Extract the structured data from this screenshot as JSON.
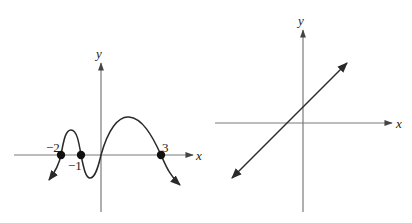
{
  "left_graph": {
    "axis_labels": {
      "x": "x",
      "y": "y"
    },
    "zero_labels": [
      "−2",
      "−1",
      "3"
    ],
    "zeros": [
      -2,
      -1,
      3
    ],
    "description": "Polynomial curve crossing the x-axis at -2, -1, 0, and 3, with end behavior falling on both sides"
  },
  "right_graph": {
    "axis_labels": {
      "x": "x",
      "y": "y"
    },
    "description": "Straight line with positive slope, small positive y-intercept, and a negative x-intercept, arrows at both ends"
  }
}
